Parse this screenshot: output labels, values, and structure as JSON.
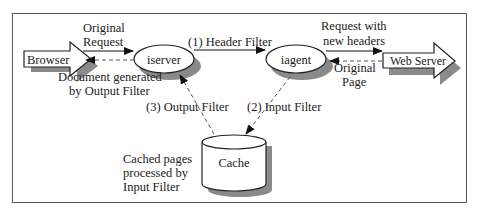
{
  "diagram": {
    "type": "architecture-flow",
    "colors": {
      "frame": "#555555",
      "stroke": "#222222",
      "shadow": "#8a8a8a",
      "fill": "#ffffff",
      "dashed": "#555555"
    },
    "nodes": {
      "browser": {
        "label": "Browser",
        "shape": "block-arrow"
      },
      "iserver": {
        "label": "iserver",
        "shape": "ellipse"
      },
      "iagent": {
        "label": "iagent",
        "shape": "ellipse"
      },
      "webserver": {
        "label": "Web Server",
        "shape": "block-arrow"
      },
      "cache": {
        "label": "Cache",
        "shape": "cylinder"
      }
    },
    "edges": {
      "original_request": {
        "line1": "Original",
        "line2": "Request",
        "style": "solid",
        "from": "browser",
        "to": "iserver"
      },
      "header_filter": {
        "label": "(1) Header Filter",
        "style": "solid",
        "from": "iserver",
        "to": "iagent"
      },
      "request_new_headers": {
        "line1": "Request with",
        "line2": "new headers",
        "style": "solid",
        "from": "iagent",
        "to": "webserver"
      },
      "original_page": {
        "line1": "Original",
        "line2": "Page",
        "style": "dashed",
        "from": "webserver",
        "to": "iagent"
      },
      "document_generated": {
        "line1": "Document generated",
        "line2": "by Output Filter",
        "style": "dashed",
        "from": "iserver",
        "to": "browser"
      },
      "input_filter": {
        "label": "(2) Input Filter",
        "style": "dashed",
        "from": "iagent",
        "to": "cache"
      },
      "output_filter": {
        "label": "(3) Output Filter",
        "style": "dashed",
        "from": "cache",
        "to": "iserver"
      }
    },
    "annotations": {
      "cache_note": {
        "line1": "Cached pages",
        "line2": "processed by",
        "line3": "Input Filter"
      }
    }
  }
}
